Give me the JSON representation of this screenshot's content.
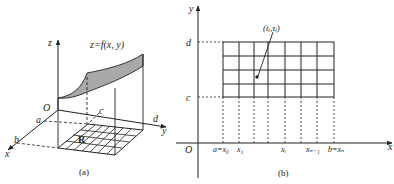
{
  "panel_a": {
    "caption": "(a)",
    "function_label": "z=f(x, y)",
    "axes": {
      "x": "x",
      "y": "y",
      "z": "z",
      "origin": "O"
    },
    "bounds": {
      "a": "a",
      "b": "b",
      "c": "c",
      "d": "d"
    },
    "region_label": "R",
    "surface_fill": "#a9a9a9"
  },
  "panel_b": {
    "caption": "(b)",
    "axes": {
      "x": "x",
      "y": "y",
      "origin": "O"
    },
    "y_ticks": {
      "d": "d",
      "c": "c"
    },
    "x_ticks": [
      "a=x₀",
      "x₁",
      "xᵢ",
      "xₙ₋₁",
      "b=xₙ"
    ],
    "point_label": "(tᵢ,τᵢ)",
    "grid": {
      "columns": 7,
      "rows": 4
    }
  }
}
